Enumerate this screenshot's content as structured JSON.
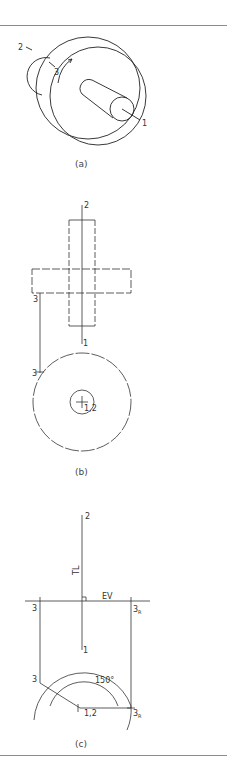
{
  "colors": {
    "rule": "#c8707f",
    "stroke": "#222222",
    "light_stroke": "#666666"
  },
  "figure_a": {
    "caption": "(a)",
    "labels": {
      "p1": "1",
      "p2": "2",
      "p3": "3"
    }
  },
  "figure_b": {
    "caption": "(b)",
    "labels": {
      "top_2": "2",
      "bottom_1": "1",
      "side_3": "3",
      "circle_3": "3",
      "center_12": "1,2"
    }
  },
  "figure_c": {
    "caption": "(c)",
    "labels": {
      "top_2": "2",
      "tl": "TL",
      "ev": "EV",
      "left_3": "3",
      "right_3r": "3",
      "right_3r_sub": "R",
      "bottom_1": "1",
      "arc_3": "3",
      "center_12": "1,2",
      "angle": "150°",
      "arc_3r": "3",
      "arc_3r_sub": "R"
    }
  }
}
